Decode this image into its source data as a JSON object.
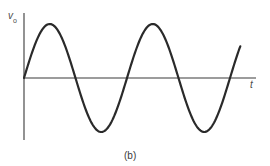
{
  "figure": {
    "caption": "(b)",
    "y_axis_label": "v",
    "y_axis_label_sub": "o",
    "x_axis_label": "t"
  },
  "colors": {
    "background": "#ffffff",
    "curve": "#2a2a2a",
    "axis": "#3a3a3a",
    "text": "#4a4a4a"
  },
  "chart_data": {
    "type": "line",
    "title": "",
    "xlabel": "t",
    "ylabel": "v_o",
    "grid": false,
    "legend": null,
    "series": [
      {
        "name": "v_o(t) sinusoid",
        "function": "A*sin(2*pi*t/T)",
        "amplitude": 1,
        "cycles_shown": 2.1,
        "x": [
          0,
          0.25,
          0.5,
          0.75,
          1.0,
          1.25,
          1.5,
          1.75,
          2.0,
          2.1
        ],
        "values": [
          0,
          1,
          0,
          -1,
          0,
          1,
          0,
          -1,
          0,
          0.59
        ]
      }
    ],
    "ylim": [
      -1,
      1
    ],
    "xlim": [
      0,
      2.25
    ]
  }
}
